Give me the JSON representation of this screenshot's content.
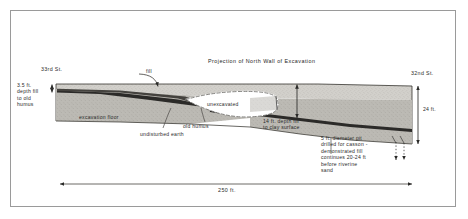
{
  "figure": {
    "title": "Projection of North Wall of Excavation",
    "border_color": "#9a9a9a",
    "background": "#ffffff"
  },
  "streets": {
    "left": "33rd St.",
    "right": "32nd St."
  },
  "measurements": {
    "left_depth": "3.5 ft.\ndepth fill\nto old\nhumus",
    "center_depth": "14 ft. depth fill\nto clay surface",
    "right_height": "24 ft.",
    "scale_bar": "250 ft."
  },
  "strata": {
    "fill": "fill",
    "old_humus": "old humus",
    "excavation_floor": "excavation floor",
    "undisturbed_earth": "undisturbed earth",
    "unexcavated": "unexcavated"
  },
  "notes": {
    "caisson_pit": "5 ft. diameter pit\ndrilled for casson -\ndemonstrated fill\ncontinues  20-24 ft\nbefore riverine\nsand"
  },
  "colors": {
    "fill_layer": "#cfcdc8",
    "lower_layer": "#b3b1ab",
    "humus_band": "#2b2a28",
    "unexcavated_fill": "#ffffff",
    "outline": "#3a3a38",
    "text": "#2a2a2a",
    "dashed": "#55534f"
  },
  "icons": {
    "fill_leader": "curved-arrow-icon",
    "depth_arrow": "double-arrow-vertical-icon",
    "scale_arrow": "double-arrow-horizontal-icon",
    "pit_arrow": "dotted-down-arrow-icon"
  }
}
